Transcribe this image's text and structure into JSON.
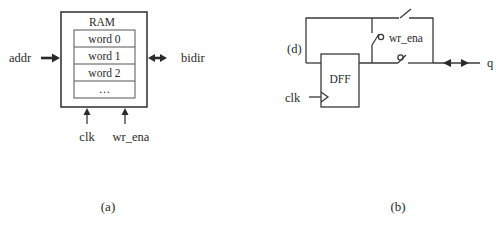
{
  "figure_a": {
    "caption": "(a)",
    "block_title": "RAM",
    "rows": [
      "word 0",
      "word 1",
      "word 2",
      "…"
    ],
    "inputs": {
      "left": "addr",
      "right": "bidir",
      "bottom": [
        "clk",
        "wr_ena"
      ]
    }
  },
  "figure_b": {
    "caption": "(b)",
    "flipflop_label": "DFF",
    "feedback_label": "(d)",
    "clock_label": "clk",
    "enable_label": "wr_ena",
    "output_label": "q"
  },
  "colors": {
    "line": "#3a3a3a",
    "text": "#2a2a2a",
    "background": "#ffffff"
  }
}
